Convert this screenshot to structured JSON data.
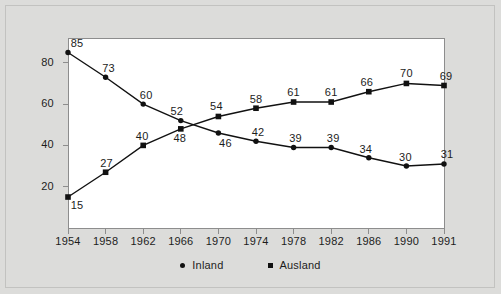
{
  "chart_data": {
    "type": "line",
    "title": "",
    "xlabel": "",
    "ylabel": "",
    "grid": false,
    "legend_position": "bottom-center",
    "categories": [
      "1954",
      "1958",
      "1962",
      "1966",
      "1970",
      "1974",
      "1978",
      "1982",
      "1986",
      "1990",
      "1991"
    ],
    "ylim": [
      0,
      92
    ],
    "yticks": [
      20,
      40,
      60,
      80
    ],
    "ytick_labels": [
      "20",
      "40",
      "60",
      "80"
    ],
    "series": [
      {
        "name": "Inland",
        "marker": "circle",
        "values": [
          85,
          73,
          60,
          52,
          46,
          42,
          39,
          39,
          34,
          30,
          31
        ],
        "value_labels": [
          "85",
          "73",
          "60",
          "52",
          "46",
          "42",
          "39",
          "39",
          "34",
          "30",
          "31"
        ]
      },
      {
        "name": "Ausland",
        "marker": "square",
        "values": [
          15,
          27,
          40,
          48,
          54,
          58,
          61,
          61,
          66,
          70,
          69
        ],
        "value_labels": [
          "15",
          "27",
          "40",
          "48",
          "54",
          "58",
          "61",
          "61",
          "66",
          "70",
          "69"
        ]
      }
    ]
  },
  "legend": {
    "entries": [
      {
        "label": "Inland",
        "marker": "circle-marker-icon"
      },
      {
        "label": "Ausland",
        "marker": "square-marker-icon"
      }
    ]
  },
  "colors": {
    "page_background": "#dcdcda",
    "plot_background": "#ffffff",
    "plot_border": "#8d8d8d",
    "outer_border": "#c2c2c0",
    "line": "#111111",
    "text": "#1c1c1c"
  }
}
